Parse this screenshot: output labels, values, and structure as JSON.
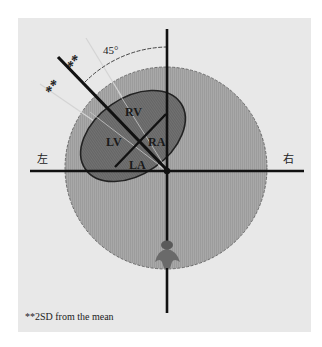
{
  "diagram": {
    "angle_label": "45°",
    "stars_outer": "**",
    "stars_inner": "**",
    "left_label": "左",
    "right_label": "右",
    "chambers": {
      "rv": "RV",
      "lv": "LV",
      "ra": "RA",
      "la": "LA"
    },
    "footnote": "**2SD from the mean",
    "colors": {
      "panel": "#e8e8e8",
      "circle_fill": "#a6a6a6",
      "heart_fill": "#6f6f6f",
      "axis": "#111111",
      "guide_line": "#cfcfcf"
    }
  }
}
